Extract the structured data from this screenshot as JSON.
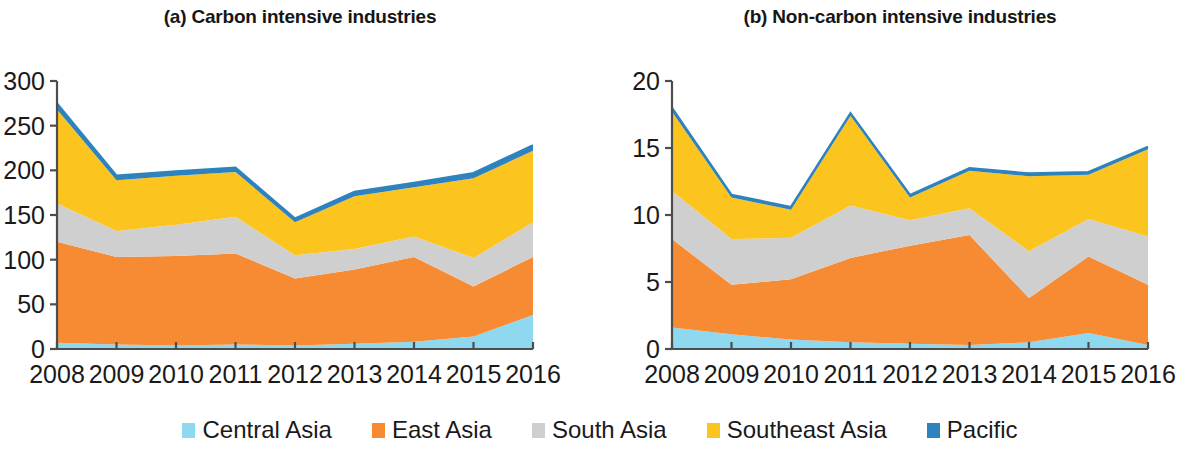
{
  "figure": {
    "background": "#ffffff",
    "panels": [
      {
        "id": "a",
        "title": "(a) Carbon intensive industries"
      },
      {
        "id": "b",
        "title": "(b) Non-carbon intensive industries"
      }
    ]
  },
  "legend": {
    "position": "bottom-center",
    "items": [
      {
        "label": "Central Asia",
        "color": "#8ed8f0"
      },
      {
        "label": "East Asia",
        "color": "#f68b33"
      },
      {
        "label": "South Asia",
        "color": "#cfcfcf"
      },
      {
        "label": "Southeast Asia",
        "color": "#fcc41f"
      },
      {
        "label": "Pacific",
        "color": "#2e82be"
      }
    ]
  },
  "chart_data": [
    {
      "type": "area",
      "stacked": true,
      "panel": "a",
      "title": "(a) Carbon intensive industries",
      "xlabel": "",
      "ylabel": "",
      "x": [
        "2008",
        "2009",
        "2010",
        "2011",
        "2012",
        "2013",
        "2014",
        "2015",
        "2016"
      ],
      "categories": [
        "2008",
        "2009",
        "2010",
        "2011",
        "2012",
        "2013",
        "2014",
        "2015",
        "2016"
      ],
      "xlim": [
        2008,
        2016
      ],
      "ylim": [
        0,
        300
      ],
      "yticks": [
        0,
        50,
        100,
        150,
        200,
        250,
        300
      ],
      "xticks": [
        "2008",
        "2009",
        "2010",
        "2011",
        "2012",
        "2013",
        "2014",
        "2015",
        "2016"
      ],
      "grid": false,
      "series": [
        {
          "name": "Central Asia",
          "color": "#8ed8f0",
          "values": [
            7,
            5,
            4,
            5,
            4,
            6,
            8,
            14,
            38
          ]
        },
        {
          "name": "East Asia",
          "color": "#f68b33",
          "values": [
            113,
            98,
            100,
            102,
            75,
            83,
            95,
            56,
            65
          ]
        },
        {
          "name": "South Asia",
          "color": "#cfcfcf",
          "values": [
            43,
            29,
            35,
            41,
            26,
            23,
            23,
            32,
            39
          ]
        },
        {
          "name": "Southeast Asia",
          "color": "#fcc41f",
          "values": [
            105,
            57,
            55,
            50,
            37,
            59,
            55,
            89,
            80
          ]
        },
        {
          "name": "Pacific",
          "color": "#2e82be",
          "values": [
            7,
            5,
            5,
            5,
            4,
            5,
            5,
            6,
            6
          ]
        }
      ],
      "totals": [
        275,
        194,
        199,
        203,
        146,
        176,
        186,
        197,
        228
      ]
    },
    {
      "type": "area",
      "stacked": true,
      "panel": "b",
      "title": "(b) Non-carbon intensive industries",
      "xlabel": "",
      "ylabel": "",
      "x": [
        "2008",
        "2009",
        "2010",
        "2011",
        "2012",
        "2013",
        "2014",
        "2015",
        "2016"
      ],
      "categories": [
        "2008",
        "2009",
        "2010",
        "2011",
        "2012",
        "2013",
        "2014",
        "2015",
        "2016"
      ],
      "xlim": [
        2008,
        2016
      ],
      "ylim": [
        0,
        20
      ],
      "yticks": [
        0,
        5,
        10,
        15,
        20
      ],
      "xticks": [
        "2008",
        "2009",
        "2010",
        "2011",
        "2012",
        "2013",
        "2014",
        "2015",
        "2016"
      ],
      "grid": false,
      "series": [
        {
          "name": "Central Asia",
          "color": "#8ed8f0",
          "values": [
            1.6,
            1.1,
            0.7,
            0.5,
            0.4,
            0.3,
            0.5,
            1.2,
            0.3
          ]
        },
        {
          "name": "East Asia",
          "color": "#f68b33",
          "values": [
            6.6,
            3.7,
            4.5,
            6.3,
            7.3,
            8.2,
            3.3,
            5.7,
            4.5
          ]
        },
        {
          "name": "South Asia",
          "color": "#cfcfcf",
          "values": [
            3.6,
            3.4,
            3.1,
            3.9,
            1.9,
            2.0,
            3.5,
            2.8,
            3.6
          ]
        },
        {
          "name": "Southeast Asia",
          "color": "#fcc41f",
          "values": [
            5.9,
            3.1,
            2.1,
            6.7,
            1.7,
            2.8,
            5.6,
            3.3,
            6.5
          ]
        },
        {
          "name": "Pacific",
          "color": "#2e82be",
          "values": [
            0.3,
            0.2,
            0.2,
            0.2,
            0.2,
            0.2,
            0.2,
            0.2,
            0.2
          ]
        }
      ],
      "totals": [
        18.0,
        11.5,
        10.6,
        17.6,
        11.5,
        13.5,
        13.1,
        13.2,
        15.1
      ]
    }
  ]
}
